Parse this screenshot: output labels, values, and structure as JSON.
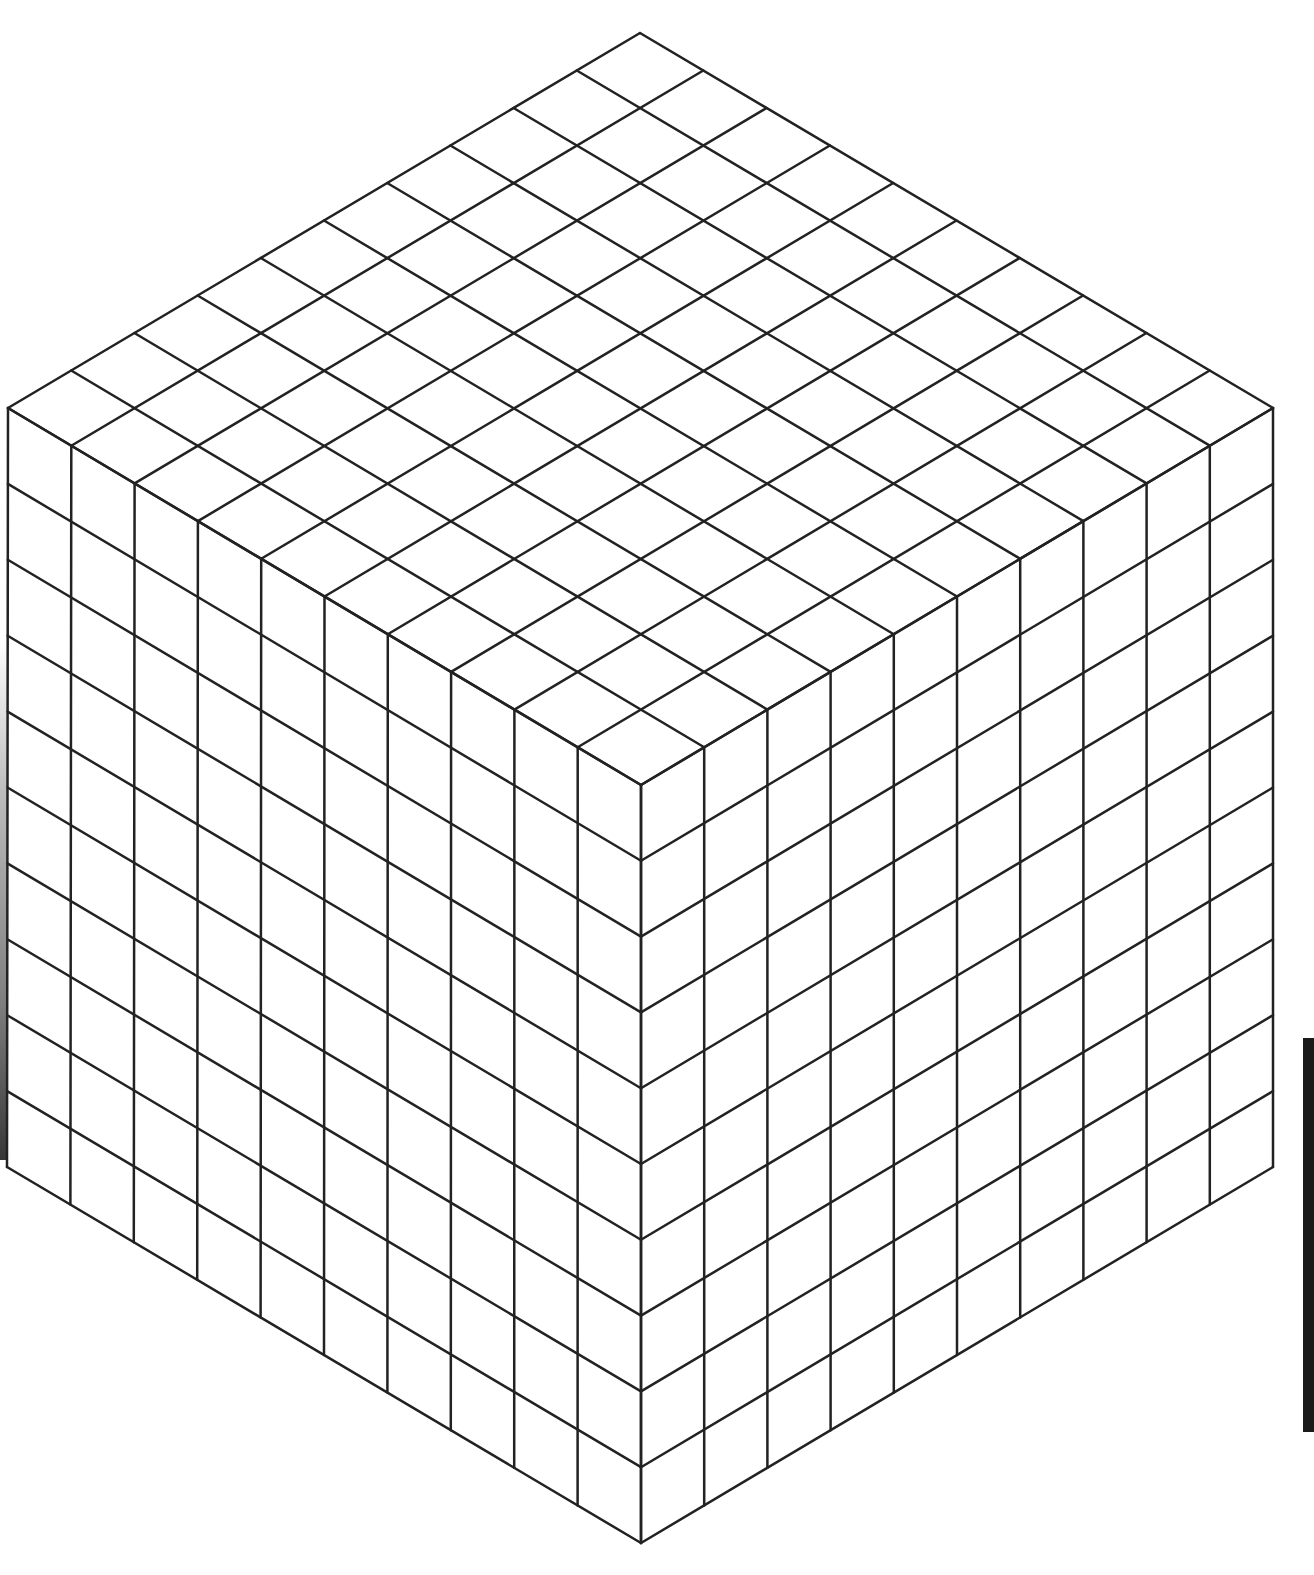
{
  "figure": {
    "title": "",
    "divisions_per_edge": 10,
    "line_color": "#222222",
    "line_width": 2.5,
    "background_color": "#ffffff",
    "vertices": {
      "top": [
        640,
        33
      ],
      "left": [
        8,
        408
      ],
      "right": [
        1273,
        408
      ],
      "center": [
        641,
        785
      ],
      "bottom_left": [
        7,
        1167
      ],
      "bottom_right": [
        1273,
        1167
      ],
      "bottom": [
        641,
        1543
      ]
    },
    "faces": [
      "top",
      "left",
      "right"
    ],
    "edge_artifacts": {
      "left_shadow": true,
      "right_bar_color": "#1a1a1a"
    }
  }
}
